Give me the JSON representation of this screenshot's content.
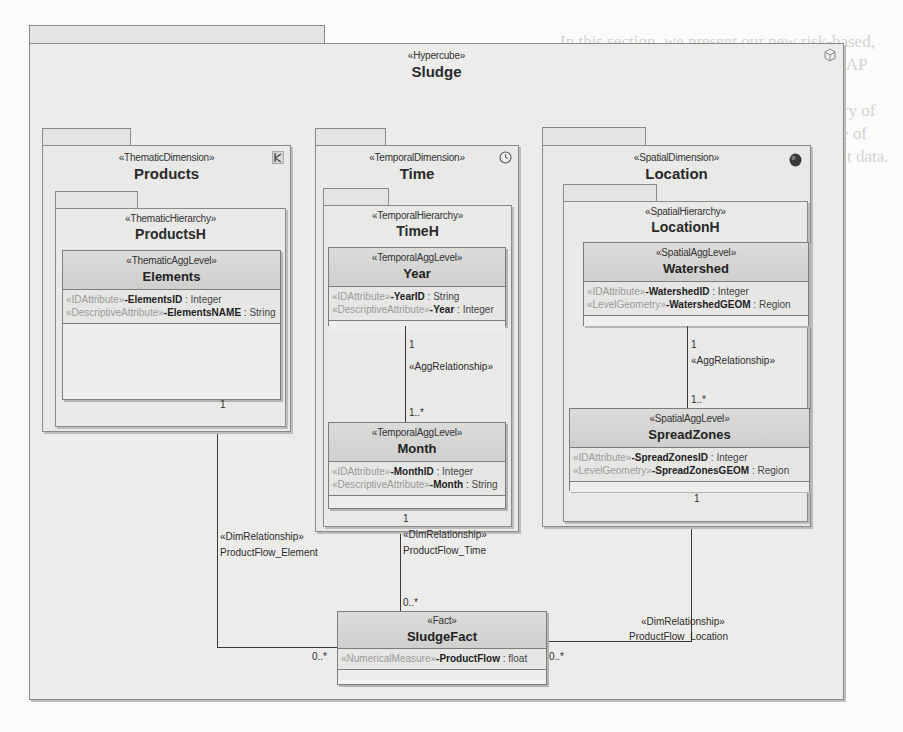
{
  "background_text": "In this section, we present our new risk-based, semi-automatic method, for designing OLAP databases, by taking into account risks of misinterpretation (e.g. multi-level summary of measure values, assuming imprecise value of aggregates, etc.) and of unsafe query result data.",
  "hypercube": {
    "stereotype": "«Hypercube»",
    "name": "Sludge",
    "icon": "cube-icon"
  },
  "dimensions": {
    "products": {
      "stereotype": "«ThematicDimension»",
      "name": "Products",
      "icon": "thematic-icon",
      "hierarchy": {
        "stereotype": "«ThematicHierarchy»",
        "name": "ProductsH",
        "levels": [
          {
            "stereotype": "«ThematicAggLevel»",
            "name": "Elements",
            "attributes": [
              {
                "stereotype": "«IDAttribute»",
                "name": "-ElementsID",
                "type": " : Integer"
              },
              {
                "stereotype": "«DescriptiveAttribute»",
                "name": "-ElementsNAME",
                "type": " : String"
              }
            ]
          }
        ]
      }
    },
    "time": {
      "stereotype": "«TemporalDimension»",
      "name": "Time",
      "icon": "clock-icon",
      "hierarchy": {
        "stereotype": "«TemporalHierarchy»",
        "name": "TimeH",
        "levels": [
          {
            "stereotype": "«TemporalAggLevel»",
            "name": "Year",
            "attributes": [
              {
                "stereotype": "«IDAttribute»",
                "name": "-YearID",
                "type": " : String"
              },
              {
                "stereotype": "«DescriptiveAttribute»",
                "name": "-Year",
                "type": " : Integer"
              }
            ]
          },
          {
            "stereotype": "«TemporalAggLevel»",
            "name": "Month",
            "attributes": [
              {
                "stereotype": "«IDAttribute»",
                "name": "-MonthID",
                "type": " : Integer"
              },
              {
                "stereotype": "«DescriptiveAttribute»",
                "name": "-Month",
                "type": " : String"
              }
            ]
          }
        ],
        "agg_relationship": {
          "stereotype": "«AggRelationship»",
          "upper_mult": "1",
          "lower_mult": "1..*"
        }
      }
    },
    "location": {
      "stereotype": "«SpatialDimension»",
      "name": "Location",
      "icon": "globe-icon",
      "hierarchy": {
        "stereotype": "«SpatialHierarchy»",
        "name": "LocationH",
        "levels": [
          {
            "stereotype": "«SpatialAggLevel»",
            "name": "Watershed",
            "attributes": [
              {
                "stereotype": "«IDAttribute»",
                "name": "-WatershedID",
                "type": " : Integer"
              },
              {
                "stereotype": "«LevelGeometry»",
                "name": "-WatershedGEOM",
                "type": " : Region"
              }
            ]
          },
          {
            "stereotype": "«SpatialAggLevel»",
            "name": "SpreadZones",
            "attributes": [
              {
                "stereotype": "«IDAttribute»",
                "name": "-SpreadZonesID",
                "type": " : Integer"
              },
              {
                "stereotype": "«LevelGeometry»",
                "name": "-SpreadZonesGEOM",
                "type": " : Region"
              }
            ]
          }
        ],
        "agg_relationship": {
          "stereotype": "«AggRelationship»",
          "upper_mult": "1",
          "lower_mult": "1..*"
        }
      }
    }
  },
  "fact": {
    "stereotype": "«Fact»",
    "name": "SludgeFact",
    "attributes": [
      {
        "stereotype": "«NumericalMeasure»",
        "name": "-ProductFlow",
        "type": " : float"
      }
    ]
  },
  "dim_relationships": {
    "element": {
      "stereotype": "«DimRelationship»",
      "name": "ProductFlow_Element",
      "dim_mult": "1",
      "fact_mult": "0..*"
    },
    "time": {
      "stereotype": "«DimRelationship»",
      "name": "ProductFlow_Time",
      "dim_mult": "1",
      "fact_mult": "0..*"
    },
    "location": {
      "stereotype": "«DimRelationship»",
      "name": "ProductFlow_Location",
      "dim_mult": "1",
      "fact_mult": "0..*"
    }
  }
}
